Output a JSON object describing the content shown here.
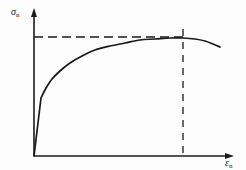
{
  "figure": {
    "type": "engineering-stress-strain-curve",
    "background_color": "#fdfdfd",
    "line_color": "#1a1a1a",
    "dash_color": "#1a1a1a"
  },
  "axes": {
    "y": {
      "symbol": "σ",
      "subscript": "n",
      "label": "σn",
      "arrow": true,
      "x_px": 34,
      "top_px": 10,
      "bottom_px": 156
    },
    "x": {
      "symbol": "ε",
      "subscript": "n",
      "label": "εn",
      "arrow": true,
      "y_px": 156,
      "left_px": 34,
      "right_px": 234
    }
  },
  "guides": {
    "horizontal": {
      "name": "ultimate-tensile-strength-guide",
      "style": "dashed",
      "y_px": 37,
      "from_x_px": 34,
      "to_x_px": 183,
      "dash": "9 5"
    },
    "vertical": {
      "name": "uniform-elongation-guide",
      "style": "dashed",
      "x_px": 183,
      "from_y_px": 29,
      "to_y_px": 156,
      "dash": "7 6"
    }
  },
  "chart_data": {
    "type": "line",
    "title": "",
    "xlabel": "εn",
    "ylabel": "σn",
    "grid": false,
    "legend": "none",
    "xlim": [
      0,
      1
    ],
    "ylim": [
      0,
      1
    ],
    "annotations": [
      {
        "name": "yield-kink",
        "x_px": 41,
        "y_px": 98
      },
      {
        "name": "uts-peak",
        "x_px": 183,
        "y_px": 38
      },
      {
        "name": "fracture-end",
        "x_px": 220,
        "y_px": 47
      }
    ],
    "series": [
      {
        "name": "engineering-stress-strain",
        "points_px": [
          [
            34,
            156
          ],
          [
            41,
            98
          ],
          [
            46,
            88
          ],
          [
            52,
            79
          ],
          [
            60,
            71
          ],
          [
            70,
            63
          ],
          [
            82,
            56
          ],
          [
            95,
            50
          ],
          [
            110,
            46
          ],
          [
            125,
            43
          ],
          [
            140,
            40
          ],
          [
            155,
            39
          ],
          [
            170,
            38
          ],
          [
            183,
            38
          ],
          [
            195,
            39
          ],
          [
            205,
            41
          ],
          [
            213,
            44
          ],
          [
            220,
            47
          ]
        ]
      }
    ]
  }
}
